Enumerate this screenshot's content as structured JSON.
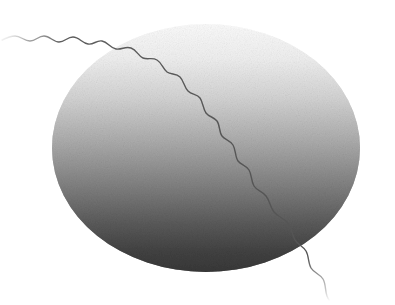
{
  "canvas": {
    "width": 395,
    "height": 305,
    "background_color": "#ffffff",
    "title": "Abstract grayscale sphere with wavy filament"
  },
  "artwork": {
    "kind": "abstract-illustration",
    "description": "Grayscale gradient sphere crossed by a thin wavy line resembling a sperm cell or a tethered balloon",
    "texture": "halftone-grain",
    "palette": {
      "background": "#ffffff",
      "sphere_top": "#fbfbfb",
      "sphere_upper_mid": "#d8d8d8",
      "sphere_mid": "#9d9d9d",
      "sphere_lower_mid": "#6a6a6a",
      "sphere_bottom": "#3a3a3a",
      "line_color": "#555555",
      "line_fade_color": "#bdbdbd",
      "seam_line_color": "#8d8d8d"
    }
  },
  "sphere": {
    "name": "gradient-sphere",
    "center_x": 206,
    "center_y": 148,
    "radius_x": 154,
    "radius_y": 124,
    "gradient_direction": "vertical",
    "gradient_stops": [
      {
        "offset": "0%",
        "color": "#fcfcfc"
      },
      {
        "offset": "14%",
        "color": "#f0f0f0"
      },
      {
        "offset": "30%",
        "color": "#d4d4d4"
      },
      {
        "offset": "48%",
        "color": "#ababab"
      },
      {
        "offset": "64%",
        "color": "#848484"
      },
      {
        "offset": "80%",
        "color": "#5c5c5c"
      },
      {
        "offset": "92%",
        "color": "#424242"
      },
      {
        "offset": "100%",
        "color": "#383838"
      }
    ]
  },
  "seam": {
    "name": "horizontal-seam-line",
    "y": 253,
    "x_start": 120,
    "x_end": 300,
    "color": "#8d8d8d",
    "opacity": 0.35
  },
  "filament": {
    "name": "wavy-filament",
    "stroke_color": "#555555",
    "stroke_width": 1.4,
    "segments": [
      {
        "id": "lead-in",
        "note": "fades in from left edge, near-horizontal ripples",
        "x_start": 2,
        "y_start": 40,
        "x_end": 120,
        "y_end": 58,
        "wave_period": 19,
        "wave_amplitude": 4.5,
        "opacity_start": 0.0,
        "opacity_end": 1.0
      },
      {
        "id": "diagonal-crossing",
        "note": "descends diagonally across the sphere face",
        "x_start": 120,
        "y_start": 58,
        "x_end": 300,
        "y_end": 205,
        "wave_period": 21,
        "wave_amplitude": 4.0,
        "opacity_start": 1.0,
        "opacity_end": 1.0
      },
      {
        "id": "tail",
        "note": "near-vertical tail exiting lower-right, fades at the tip",
        "x_start": 300,
        "y_start": 205,
        "x_end": 330,
        "y_end": 300,
        "wave_period": 24,
        "wave_amplitude": 5.0,
        "opacity_start": 1.0,
        "opacity_end": 0.0
      }
    ],
    "path_d": "M 2,40 C 6,38 10,36 15,36 C 21,36 24,41 30,41 C 36,41 38,36 44,36 C 50,36 53,42 59,42 C 65,42 67,37 73,37 C 79,37 82,43 88,44 C 94,45 96,40 102,41 C 108,42 110,48 116,49 C 122,50 125,46 131,48 C 137,50 138,56 143,58 C 148,60 152,57 157,60 C 162,63 163,69 167,72 C 171,75 176,73 180,77 C 184,81 184,87 188,91 C 192,95 197,94 200,98 C 203,102 203,109 206,113 C 209,117 214,117 217,121 C 220,125 219,132 222,136 C 225,140 230,140 233,145 C 236,150 235,157 238,161 C 241,165 246,165 249,170 C 252,175 251,181 254,186 C 257,191 262,191 266,196 C 270,201 270,207 274,212 C 278,217 284,218 288,223 C 292,228 292,235 295,240 C 298,245 303,246 306,251 C 309,256 308,263 311,268 C 314,273 320,274 323,279 C 326,284 325,291 327,296 C 328,299 329,300 330,301"
  },
  "labels": {
    "alt_text": "Abstract grayscale illustration of a gradient sphere with a long wavy filament crossing it diagonally"
  }
}
